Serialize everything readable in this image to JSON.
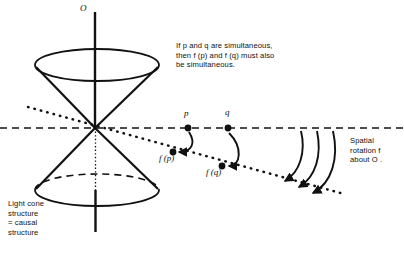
{
  "figure": {
    "background_color": "#ffffff",
    "ink_color": "#111111",
    "width": 404,
    "height": 259
  },
  "annotations": {
    "simultaneity_note": "If p and q are simultaneous,\nthen f (p) and f (q) must also\nbe simultaneous.",
    "rotation_note": "Spatial\nrotation f\nabout O .",
    "light_cone_note": "Light cone\nstructure\n= causal\nstructure"
  },
  "labels": {
    "axis_O": "O",
    "point_p": "p",
    "point_q": "q",
    "point_fp": "f (p)",
    "point_fq": "f (q)"
  },
  "geometry": {
    "origin": {
      "x": 95,
      "y": 128
    },
    "axis": {
      "x": 95,
      "top_y": 12,
      "bottom_y": 232
    },
    "upper_cone": {
      "ellipse_center_x": 97,
      "ellipse_center_y": 65,
      "rx": 62,
      "ry": 16,
      "style": "solid"
    },
    "lower_cone": {
      "ellipse_center_x": 97,
      "ellipse_center_y": 190,
      "rx": 62,
      "ry": 16,
      "front_style": "solid",
      "back_style": "dashed"
    },
    "horizontal_line": {
      "y": 128,
      "x_start": 0,
      "x_end": 404,
      "style": "dashed"
    },
    "slanted_line": {
      "x_start": 28,
      "y_start": 107,
      "x_end": 344,
      "y_end": 194,
      "style": "dotted"
    },
    "points": [
      {
        "name": "p",
        "x": 188,
        "y": 128
      },
      {
        "name": "q",
        "x": 228,
        "y": 128
      },
      {
        "name": "f(p)",
        "x": 173,
        "y": 152
      },
      {
        "name": "f(q)",
        "x": 222,
        "y": 166
      }
    ],
    "rotation_arrows": [
      {
        "start_x": 300,
        "start_y": 131,
        "end_x": 281,
        "end_y": 181
      },
      {
        "start_x": 315,
        "start_y": 131,
        "end_x": 295,
        "end_y": 187
      },
      {
        "start_x": 330,
        "start_y": 131,
        "end_x": 309,
        "end_y": 193
      }
    ]
  }
}
